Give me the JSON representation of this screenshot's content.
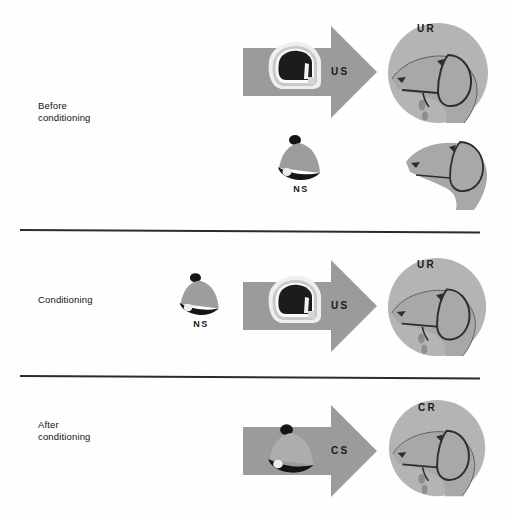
{
  "figure": {
    "background_color": "#fefefe",
    "width": 508,
    "height": 521
  },
  "colors": {
    "arrow_gray": "#9b9b9b",
    "circle_gray": "#b4b4b4",
    "dog_gray": "#a8a8a8",
    "dog_outline": "#2d2d2d",
    "bell_body": "#9d9d9d",
    "bell_dark": "#151515",
    "meat_dark": "#1c1c1c",
    "meat_light": "#e9e9e9",
    "divider": "#2b2b2b",
    "text": "#121212"
  },
  "phases": [
    {
      "id": "before",
      "label": "Before\nconditioning",
      "rows": [
        {
          "id": "before-us-ur",
          "stimulus_type": "arrow-with-meat",
          "stimulus_symbol": "US",
          "stimulus_name": "unconditioned-stimulus",
          "icon": "meat-icon",
          "response_symbol": "UR",
          "response_name": "unconditioned-response",
          "dog_salivating": true,
          "dog_in_circle": true
        },
        {
          "id": "before-ns-none",
          "stimulus_type": "bell-alone",
          "stimulus_symbol": "NS",
          "stimulus_name": "neutral-stimulus",
          "icon": "bell-icon",
          "response_symbol": "",
          "response_name": "no-response",
          "dog_salivating": false,
          "dog_in_circle": false
        }
      ]
    },
    {
      "id": "conditioning",
      "label": "Conditioning",
      "rows": [
        {
          "id": "conditioning-ns-us-ur",
          "stimulus_type": "bell-plus-arrow-with-meat",
          "stimulus_symbol": "US",
          "stimulus_name": "unconditioned-stimulus",
          "bell_symbol": "NS",
          "bell_name": "neutral-stimulus",
          "icon": "meat-icon",
          "response_symbol": "UR",
          "response_name": "unconditioned-response",
          "dog_salivating": true,
          "dog_in_circle": true
        }
      ]
    },
    {
      "id": "after",
      "label": "After\nconditioning",
      "rows": [
        {
          "id": "after-cs-cr",
          "stimulus_type": "arrow-with-bell",
          "stimulus_symbol": "CS",
          "stimulus_name": "conditioned-stimulus",
          "icon": "bell-icon",
          "response_symbol": "CR",
          "response_name": "conditioned-response",
          "dog_salivating": true,
          "dog_in_circle": true
        }
      ]
    }
  ],
  "labels": {
    "before_conditioning": "Before\nconditioning",
    "conditioning": "Conditioning",
    "after_conditioning": "After\nconditioning",
    "us": "US",
    "ns": "NS",
    "cs": "CS",
    "ur": "UR",
    "cr": "CR"
  }
}
